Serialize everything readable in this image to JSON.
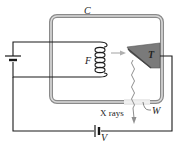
{
  "diagram": {
    "labels": {
      "envelope": "C",
      "filament": "F",
      "target": "T",
      "window": "W",
      "voltage": "V",
      "xrays": "X rays"
    },
    "colors": {
      "wire": "#1a1a1a",
      "envelope_outer": "#8a8a8a",
      "envelope_inner": "#d0d0d0",
      "target_fill": "#7a7a7a",
      "target_edge": "#444444",
      "electron_arrow": "#b0b0b0",
      "xray_line": "#8f8f8f",
      "window": "#e6e6e6"
    }
  }
}
